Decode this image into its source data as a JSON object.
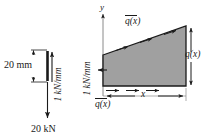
{
  "figure": {
    "background": "#ffffff",
    "ink_color": "#1a1a1a",
    "wedge_fill": "#a0a0a0",
    "wedge_stroke": "#1a1a1a"
  },
  "left_figure": {
    "name": "point-load-equivalence",
    "dimension_label": "20 mm",
    "load_intensity_label": "1 kN/mm",
    "resultant_force_label": "20 kN",
    "dimension_value": 20,
    "dimension_unit": "mm",
    "intensity_value": 1,
    "intensity_unit": "kN/mm",
    "resultant_value": 20,
    "resultant_unit": "kN"
  },
  "right_figure": {
    "name": "triangular-distributed-load",
    "axis_y_label": "y",
    "axis_x_label": "x",
    "intensity_label": "1 kN/mm",
    "top_load_label": "q(x)",
    "top_load_overbar": true,
    "bottom_load_label": "q(x)",
    "bottom_load_overbar": true,
    "right_load_label": "q(x)",
    "right_load_overbar": false,
    "distance_label": "x",
    "shape": "wedge",
    "shape_description": "right trapezoid increasing to the right"
  }
}
